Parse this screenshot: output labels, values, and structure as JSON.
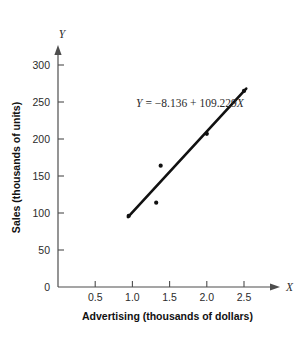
{
  "figure": {
    "background_color": "#ffffff",
    "ink_color": "#111111",
    "axis_color": "#4d4d4d"
  },
  "chart_data": {
    "type": "scatter",
    "title": "",
    "xlabel": "Advertising (thousands of dollars)",
    "ylabel": "Sales (thousands of units)",
    "x_axis_name": "X",
    "y_axis_name": "Y",
    "xlim": [
      0,
      2.9
    ],
    "ylim": [
      0,
      320
    ],
    "xticks": [
      0.5,
      1.0,
      1.5,
      2.0,
      2.5
    ],
    "xtick_labels": [
      "0.5",
      "1.0",
      "1.5",
      "2.0",
      "2.5"
    ],
    "yticks": [
      50,
      100,
      150,
      200,
      250,
      300
    ],
    "ytick_labels": [
      "50",
      "100",
      "150",
      "200",
      "250",
      "300"
    ],
    "origin_label": "0",
    "grid": false,
    "legend": false,
    "points": [
      {
        "x": 0.95,
        "y": 96
      },
      {
        "x": 1.32,
        "y": 114
      },
      {
        "x": 1.38,
        "y": 164
      },
      {
        "x": 2.0,
        "y": 207
      },
      {
        "x": 2.5,
        "y": 265
      }
    ],
    "fit_line": {
      "intercept": -8.136,
      "slope": 109.229,
      "x_start": 0.94,
      "x_end": 2.53
    },
    "annotation": {
      "text": "Y = −8.136 + 109.229X",
      "lhs": "Y",
      "equals": " = ",
      "intercept_part": "−8.136",
      "plus": " + ",
      "slope_part": "109.229",
      "rhs_var": "X",
      "x": 1.05,
      "y": 243
    }
  }
}
